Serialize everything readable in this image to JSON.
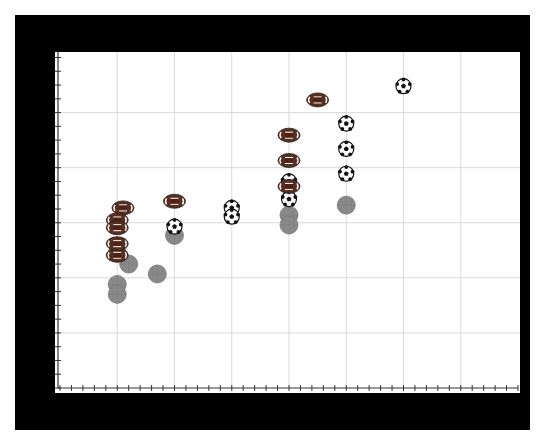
{
  "chart_data": {
    "type": "scatter",
    "title": "",
    "xlabel": "",
    "ylabel": "",
    "xlim": [
      0,
      8
    ],
    "ylim": [
      0,
      6.1
    ],
    "grid": true,
    "legend": null,
    "x_major_ticks": [
      1,
      2,
      3,
      4,
      5,
      6,
      7
    ],
    "y_major_ticks": [
      1,
      2,
      3,
      4,
      5
    ],
    "x_minor_per_major": 5,
    "y_minor_per_major": 4,
    "tick_labels_visible": false,
    "series": [
      {
        "name": "football",
        "marker": "american-football-icon",
        "points": [
          [
            1.0,
            2.41
          ],
          [
            1.1,
            3.27
          ],
          [
            1.0,
            3.05
          ],
          [
            1.0,
            2.91
          ],
          [
            1.0,
            2.62
          ],
          [
            2.0,
            3.39
          ],
          [
            4.0,
            4.59
          ],
          [
            4.0,
            4.13
          ],
          [
            4.0,
            3.66
          ],
          [
            4.5,
            5.23
          ]
        ]
      },
      {
        "name": "soccer",
        "marker": "soccer-ball-icon",
        "points": [
          [
            2.0,
            2.93
          ],
          [
            3.0,
            3.27
          ],
          [
            3.0,
            3.11
          ],
          [
            4.0,
            3.75
          ],
          [
            4.0,
            3.43
          ],
          [
            5.0,
            4.8
          ],
          [
            5.0,
            4.34
          ],
          [
            5.0,
            3.89
          ],
          [
            6.0,
            5.48
          ]
        ]
      },
      {
        "name": "basketball",
        "marker": "basketball-icon",
        "points": [
          [
            1.0,
            1.88
          ],
          [
            1.0,
            1.7
          ],
          [
            1.7,
            2.07
          ],
          [
            1.0,
            2.45
          ],
          [
            1.2,
            2.25
          ],
          [
            2.0,
            2.77
          ],
          [
            4.0,
            3.14
          ],
          [
            4.0,
            2.96
          ],
          [
            5.0,
            3.32
          ]
        ]
      }
    ]
  },
  "style": {
    "frame_color": "#000000",
    "plot_bg": "#ffffff",
    "grid_color": "#d9d9d9",
    "axis_color": "#333333",
    "football_color": "#5a2e1e",
    "basketball_color": "#8a8a8a"
  }
}
